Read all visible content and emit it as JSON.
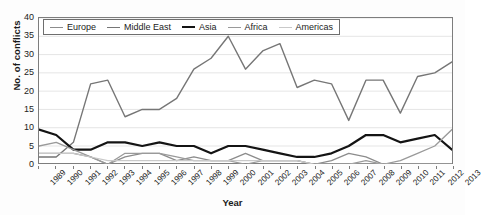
{
  "chart_data": {
    "type": "line",
    "title": "",
    "xlabel": "Year",
    "ylabel": "No. of conflicts",
    "x": [
      1989,
      1990,
      1991,
      1992,
      1993,
      1994,
      1995,
      1996,
      1997,
      1998,
      1999,
      2000,
      2001,
      2002,
      2003,
      2004,
      2005,
      2006,
      2007,
      2008,
      2009,
      2010,
      2011,
      2012,
      2013
    ],
    "categories": [
      "1989",
      "1990",
      "1991",
      "1992",
      "1993",
      "1994",
      "1995",
      "1996",
      "1997",
      "1998",
      "1999",
      "2000",
      "2001",
      "2002",
      "2003",
      "2004",
      "2005",
      "2006",
      "2007",
      "2008",
      "2009",
      "2010",
      "2011",
      "2012",
      "2013"
    ],
    "xlim": [
      1989,
      2013
    ],
    "ylim": [
      0,
      40
    ],
    "yticks": [
      0,
      5,
      10,
      15,
      20,
      25,
      30,
      35,
      40
    ],
    "grid": true,
    "grid_axis": "y",
    "legend_position": "top-left-inside",
    "series": [
      {
        "name": "Europe",
        "color": "#8c8c8c",
        "width": 1.3,
        "values": [
          3,
          3,
          3,
          2,
          0,
          2,
          3,
          3,
          1,
          2,
          1,
          1,
          3,
          1,
          1,
          1,
          0,
          1,
          3,
          2,
          0,
          0,
          0,
          0,
          0
        ]
      },
      {
        "name": "Middle East",
        "color": "#767676",
        "width": 1.4,
        "values": [
          2,
          2,
          6,
          22,
          23,
          13,
          15,
          15,
          18,
          26,
          29,
          35,
          26,
          31,
          33,
          21,
          23,
          22,
          12,
          23,
          23,
          14,
          24,
          25,
          28
        ]
      },
      {
        "name": "Asia",
        "color": "#141414",
        "width": 2.2,
        "values": [
          9.5,
          8,
          4,
          4,
          6,
          6,
          5,
          6,
          5,
          5,
          3,
          5,
          5,
          4,
          3,
          2,
          2,
          3,
          5,
          8,
          8,
          6,
          7,
          8,
          4
        ]
      },
      {
        "name": "Africa",
        "color": "#9a9a9a",
        "width": 1.3,
        "values": [
          5,
          6,
          4,
          2,
          0,
          3,
          3,
          3,
          2,
          1,
          1,
          1,
          0,
          1,
          1,
          1,
          0,
          0,
          0,
          1,
          0,
          1,
          3,
          5,
          9.5
        ]
      },
      {
        "name": "Americas",
        "color": "#c9c9c9",
        "width": 1.2,
        "values": [
          3,
          3,
          3,
          2,
          1,
          1,
          1,
          1,
          1,
          1,
          1,
          1,
          1,
          1,
          1,
          1,
          0,
          0,
          0,
          0,
          0,
          0,
          0,
          0,
          0
        ]
      }
    ]
  },
  "legend": {
    "items": [
      {
        "label": "Europe"
      },
      {
        "label": "Middle East"
      },
      {
        "label": "Asia"
      },
      {
        "label": "Africa"
      },
      {
        "label": "Americas"
      }
    ]
  }
}
